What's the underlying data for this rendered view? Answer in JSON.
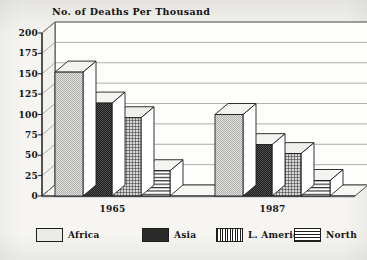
{
  "chart_data": {
    "type": "bar",
    "title": "No. of Deaths Per Thousand",
    "xlabel": "",
    "ylabel": "",
    "ylim": [
      0,
      200
    ],
    "yticks": [
      0,
      25,
      50,
      75,
      100,
      125,
      150,
      175,
      200
    ],
    "ytick_labels": [
      "0",
      "25",
      "50",
      "75",
      "100",
      "125",
      "150",
      "175",
      "200"
    ],
    "grid": true,
    "grid_axis": "y",
    "legend_position": "bottom",
    "style": "3d-bar",
    "categories": [
      "1965",
      "1987"
    ],
    "series": [
      {
        "name": "Africa",
        "values": [
          152,
          100
        ],
        "color": "#e9ece6",
        "pattern": "solid-light"
      },
      {
        "name": "Asia",
        "values": [
          114,
          63
        ],
        "color": "#2b2b2b",
        "pattern": "solid-dark"
      },
      {
        "name": "L. America",
        "values": [
          96,
          52
        ],
        "color": "#cfcfcf",
        "pattern": "crosshatch"
      },
      {
        "name": "North",
        "values": [
          31,
          19
        ],
        "color": "#d8d8d8",
        "pattern": "horizontal-lines"
      }
    ]
  },
  "legend": {
    "items": [
      {
        "label": "Africa"
      },
      {
        "label": "Asia"
      },
      {
        "label": "L. America"
      },
      {
        "label": "North"
      }
    ]
  },
  "axis": {
    "x_labels": [
      {
        "label": "1965"
      },
      {
        "label": "1987"
      }
    ]
  }
}
